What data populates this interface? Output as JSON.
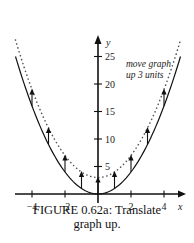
{
  "chart_data": {
    "type": "line",
    "title": "FIGURE 0.62a: Translate graph up.",
    "xlabel": "x",
    "ylabel": "y",
    "xlim": [
      -5.2,
      5.2
    ],
    "ylim": [
      0,
      28
    ],
    "x_ticks": [
      -4,
      -2,
      2,
      4
    ],
    "x_tick_labels": [
      "−4",
      "−2",
      "2",
      "4"
    ],
    "y_ticks": [
      5,
      10,
      15,
      20,
      25
    ],
    "y_tick_labels": [
      "5",
      "10",
      "15",
      "20",
      "25"
    ],
    "grid": false,
    "series": [
      {
        "name": "y = x^2",
        "style": "solid",
        "x": [
          -5,
          -4,
          -3,
          -2,
          -1,
          0,
          1,
          2,
          3,
          4,
          5
        ],
        "y": [
          25,
          16,
          9,
          4,
          1,
          0,
          1,
          4,
          9,
          16,
          25
        ]
      },
      {
        "name": "y = x^2 + 3",
        "style": "dotted",
        "x": [
          -5,
          -4,
          -3,
          -2,
          -1,
          0,
          1,
          2,
          3,
          4,
          5
        ],
        "y": [
          28,
          19,
          12,
          7,
          4,
          3,
          4,
          7,
          12,
          19,
          28
        ]
      }
    ],
    "arrows": [
      {
        "x": -4,
        "from": 16,
        "to": 19
      },
      {
        "x": -3,
        "from": 9,
        "to": 12
      },
      {
        "x": -2,
        "from": 4,
        "to": 7
      },
      {
        "x": -1,
        "from": 1,
        "to": 4
      },
      {
        "x": 0,
        "from": 0,
        "to": 3
      },
      {
        "x": 1,
        "from": 1,
        "to": 4
      },
      {
        "x": 2,
        "from": 4,
        "to": 7
      },
      {
        "x": 3,
        "from": 9,
        "to": 12
      },
      {
        "x": 4,
        "from": 16,
        "to": 19
      }
    ],
    "annotations": [
      {
        "text": "move graph up 3 units",
        "lines": [
          "move graph",
          "up 3 units"
        ]
      }
    ]
  },
  "caption": {
    "line1": "FIGURE 0.62a: Translate",
    "line2": "graph up."
  },
  "axis": {
    "x_label": "x",
    "y_label": "y"
  },
  "annotation": {
    "line1": "move graph",
    "line2": "up 3 units"
  },
  "colors": {
    "curve": "#111111",
    "dotted": "#555555",
    "axis": "#111111"
  }
}
